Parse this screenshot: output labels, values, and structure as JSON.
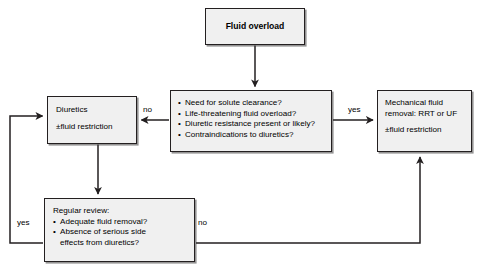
{
  "diagram": {
    "type": "flowchart",
    "colors": {
      "node_fill": "#f0f0f0",
      "node_border": "#231f20",
      "edge": "#231f20",
      "text": "#000000",
      "background": "#ffffff"
    },
    "nodes": {
      "fluid_overload": {
        "label": "Fluid overload"
      },
      "decision": {
        "bullets": [
          "Need for solute clearance?",
          "Life-threatening fluid overload?",
          "Diuretic resistance present or likely?",
          "Contraindications to diuretics?"
        ]
      },
      "diuretics": {
        "line1": "Diuretics",
        "line2": "±fluid restriction"
      },
      "mechanical": {
        "line1": "Mechanical fluid",
        "line2": "removal: RRT or UF",
        "line3": "±fluid restriction"
      },
      "review": {
        "heading": "Regular review:",
        "bullet1": "Adequate fluid removal?",
        "bullet2_line1": "Absence of serious side",
        "bullet2_line2": "effects from diuretics?"
      }
    },
    "edge_labels": {
      "decision_to_diuretics": "no",
      "decision_to_mechanical": "yes",
      "review_to_diuretics": "yes",
      "review_to_mechanical": "no"
    }
  }
}
